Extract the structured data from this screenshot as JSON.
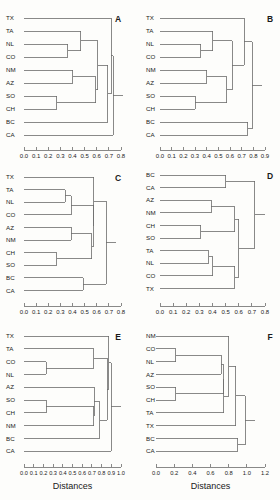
{
  "figure": {
    "title": "",
    "panel_count": 6,
    "axis_title": "Distances",
    "line_color": "#6b6b6b",
    "text_color": "#1a1a1a",
    "background": "#fdfdfb"
  },
  "chart_data": [
    {
      "type": "dendrogram",
      "panel": "A",
      "title": "A",
      "xlabel": "",
      "ylabel": "",
      "xlim": [
        0.0,
        0.8
      ],
      "ticks": [
        "0.0",
        "0.1",
        "0.2",
        "0.3",
        "0.4",
        "0.5",
        "0.6",
        "0.7",
        "0.8"
      ],
      "tick_values": [
        0.0,
        0.1,
        0.2,
        0.3,
        0.4,
        0.5,
        0.6,
        0.7,
        0.8
      ],
      "grid": false,
      "leaves": [
        "TX",
        "TA",
        "NL",
        "CO",
        "NM",
        "AZ",
        "SO",
        "CH",
        "BC",
        "CA"
      ],
      "merges": [
        {
          "left": "NL",
          "right": "CO",
          "height": 0.36
        },
        {
          "left": "TA",
          "right": "NL+CO",
          "height": 0.47
        },
        {
          "left": "NM",
          "right": "AZ",
          "height": 0.4
        },
        {
          "left": "SO",
          "right": "CH",
          "height": 0.27
        },
        {
          "left": "NM+AZ",
          "right": "SO+CH",
          "height": 0.59
        },
        {
          "left": "TA+NL+CO",
          "right": "NM+AZ+SO+CH",
          "height": 0.61
        },
        {
          "left": "cluster1",
          "right": "BC",
          "height": 0.69
        },
        {
          "left": "TX",
          "right": "cluster2",
          "height": 0.72
        },
        {
          "left": "all",
          "right": "CA",
          "height": 0.73
        }
      ]
    },
    {
      "type": "dendrogram",
      "panel": "B",
      "title": "B",
      "xlabel": "",
      "ylabel": "",
      "xlim": [
        0.0,
        0.9
      ],
      "ticks": [
        "0.0",
        "0.1",
        "0.2",
        "0.3",
        "0.4",
        "0.5",
        "0.6",
        "0.7",
        "0.8",
        "0.9"
      ],
      "tick_values": [
        0.0,
        0.1,
        0.2,
        0.3,
        0.4,
        0.5,
        0.6,
        0.7,
        0.8,
        0.9
      ],
      "grid": false,
      "leaves": [
        "TX",
        "TA",
        "NL",
        "CO",
        "NM",
        "AZ",
        "SO",
        "CH",
        "BC",
        "CA"
      ],
      "merges": [
        {
          "left": "NL",
          "right": "CO",
          "height": 0.35
        },
        {
          "left": "TA",
          "right": "NL+CO",
          "height": 0.45
        },
        {
          "left": "NM",
          "right": "AZ",
          "height": 0.4
        },
        {
          "left": "SO",
          "right": "CH",
          "height": 0.3
        },
        {
          "left": "NM+AZ",
          "right": "SO+CH",
          "height": 0.57
        },
        {
          "left": "TA+NL+CO",
          "right": "cluster",
          "height": 0.62
        },
        {
          "left": "TX",
          "right": "cluster2",
          "height": 0.72
        },
        {
          "left": "BC",
          "right": "CA",
          "height": 0.75
        },
        {
          "left": "all",
          "right": "BC+CA",
          "height": 0.79
        }
      ]
    },
    {
      "type": "dendrogram",
      "panel": "C",
      "title": "C",
      "xlabel": "",
      "ylabel": "",
      "xlim": [
        0.0,
        0.8
      ],
      "ticks": [
        "0.0",
        "0.1",
        "0.2",
        "0.3",
        "0.4",
        "0.5",
        "0.6",
        "0.7",
        "0.8"
      ],
      "tick_values": [
        0.0,
        0.1,
        0.2,
        0.3,
        0.4,
        0.5,
        0.6,
        0.7,
        0.8
      ],
      "grid": false,
      "leaves": [
        "TX",
        "TA",
        "NL",
        "CO",
        "AZ",
        "NM",
        "CH",
        "SO",
        "BC",
        "CA"
      ],
      "merges": [
        {
          "left": "TA",
          "right": "NL",
          "height": 0.34
        },
        {
          "left": "TA+NL",
          "right": "CO",
          "height": 0.39
        },
        {
          "left": "AZ",
          "right": "NM",
          "height": 0.39
        },
        {
          "left": "CH",
          "right": "SO",
          "height": 0.27
        },
        {
          "left": "AZ+NM",
          "right": "CH+SO",
          "height": 0.56
        },
        {
          "left": "TA+NL+CO",
          "right": "cluster",
          "height": 0.58
        },
        {
          "left": "TX",
          "right": "cluster2",
          "height": 0.57
        },
        {
          "left": "BC",
          "right": "CA",
          "height": 0.49
        },
        {
          "left": "all",
          "right": "BC+CA",
          "height": 0.68
        }
      ]
    },
    {
      "type": "dendrogram",
      "panel": "D",
      "title": "D",
      "xlabel": "",
      "ylabel": "",
      "xlim": [
        0.0,
        0.8
      ],
      "ticks": [
        "0.0",
        "0.1",
        "0.2",
        "0.3",
        "0.4",
        "0.5",
        "0.6",
        "0.7",
        "0.8"
      ],
      "tick_values": [
        0.0,
        0.1,
        0.2,
        0.3,
        0.4,
        0.5,
        0.6,
        0.7,
        0.8
      ],
      "grid": false,
      "leaves": [
        "BC",
        "CA",
        "AZ",
        "NM",
        "CH",
        "SO",
        "TA",
        "NL",
        "CO",
        "TX"
      ],
      "merges": [
        {
          "left": "BC",
          "right": "CA",
          "height": 0.5
        },
        {
          "left": "AZ",
          "right": "NM",
          "height": 0.39
        },
        {
          "left": "CH",
          "right": "SO",
          "height": 0.31
        },
        {
          "left": "AZ+NM",
          "right": "CH+SO",
          "height": 0.57
        },
        {
          "left": "TA",
          "right": "NL",
          "height": 0.37
        },
        {
          "left": "TA+NL",
          "right": "CO",
          "height": 0.4
        },
        {
          "left": "TA+NL+CO",
          "right": "TX",
          "height": 0.57
        },
        {
          "left": "cluster1",
          "right": "cluster2",
          "height": 0.6
        },
        {
          "left": "BC+CA",
          "right": "rest",
          "height": 0.72
        }
      ]
    },
    {
      "type": "dendrogram",
      "panel": "E",
      "title": "E",
      "xlabel": "Distances",
      "ylabel": "",
      "xlim": [
        0.0,
        1.0
      ],
      "ticks": [
        "0.0",
        "0.1",
        "0.2",
        "0.3",
        "0.4",
        "0.5",
        "0.6",
        "0.7",
        "0.8",
        "0.9",
        "1.0"
      ],
      "tick_values": [
        0.0,
        0.1,
        0.2,
        0.3,
        0.4,
        0.5,
        0.6,
        0.7,
        0.8,
        0.9,
        1.0
      ],
      "grid": false,
      "leaves": [
        "TX",
        "TA",
        "CO",
        "NL",
        "AZ",
        "SO",
        "CH",
        "NM",
        "BC",
        "CA"
      ],
      "merges": [
        {
          "left": "CO",
          "right": "NL",
          "height": 0.23
        },
        {
          "left": "TA",
          "right": "CO+NL",
          "height": 0.72
        },
        {
          "left": "SO",
          "right": "CH",
          "height": 0.23
        },
        {
          "left": "SO+CH",
          "right": "NM",
          "height": 0.72
        },
        {
          "left": "AZ",
          "right": "cluster",
          "height": 0.72
        },
        {
          "left": "cluster2",
          "right": "BC",
          "height": 0.78
        },
        {
          "left": "TX",
          "right": "cluster3",
          "height": 0.86
        },
        {
          "left": "all",
          "right": "CA",
          "height": 0.9
        }
      ]
    },
    {
      "type": "dendrogram",
      "panel": "F",
      "title": "F",
      "xlabel": "Distances",
      "ylabel": "",
      "xlim": [
        0.0,
        1.2
      ],
      "ticks": [
        "0.0",
        "0.2",
        "0.4",
        "0.6",
        "0.8",
        "1.0",
        "1.2"
      ],
      "tick_values": [
        0.0,
        0.2,
        0.4,
        0.6,
        0.8,
        1.0,
        1.2
      ],
      "grid": false,
      "leaves": [
        "NM",
        "CO",
        "NL",
        "AZ",
        "SO",
        "CH",
        "TA",
        "TX",
        "BC",
        "CA"
      ],
      "merges": [
        {
          "left": "CO",
          "right": "NL",
          "height": 0.22
        },
        {
          "left": "SO",
          "right": "CH",
          "height": 0.22
        },
        {
          "left": "CO+NL",
          "right": "AZ",
          "height": 0.72
        },
        {
          "left": "cluster",
          "right": "TA",
          "height": 0.74
        },
        {
          "left": "NM",
          "right": "cluster2",
          "height": 0.8
        },
        {
          "left": "cluster3",
          "right": "TX",
          "height": 0.88
        },
        {
          "left": "BC",
          "right": "CA",
          "height": 0.9
        },
        {
          "left": "all",
          "right": "BC+CA",
          "height": 0.98
        }
      ]
    }
  ],
  "panels": {
    "A": {
      "label": "A",
      "axis_title": ""
    },
    "B": {
      "label": "B",
      "axis_title": ""
    },
    "C": {
      "label": "C",
      "axis_title": ""
    },
    "D": {
      "label": "D",
      "axis_title": ""
    },
    "E": {
      "label": "E",
      "axis_title": "Distances"
    },
    "F": {
      "label": "F",
      "axis_title": "Distances"
    }
  }
}
